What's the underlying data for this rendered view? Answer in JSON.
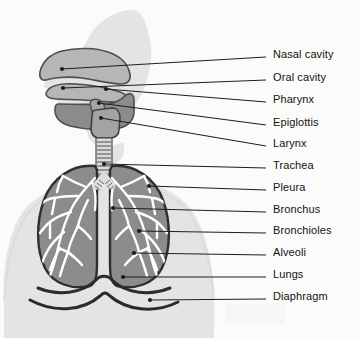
{
  "figure": {
    "orientation": "anterior torso with left-facing head profile",
    "background_color": "#fbfbfa",
    "colors": {
      "body_silhouette": "#e3e3e1",
      "lung_fill": "#8c8c8c",
      "lung_outline": "#2f2f2f",
      "bronchial_tree": "#ffffff",
      "pharynx_fill": "#8a8a8a",
      "cavity_fill": "#b4b4b2",
      "airway_outline": "#4a4a4a",
      "diaphragm": "#2b2b2b",
      "leader_line": "#1d1d1d",
      "label_text": "#131313"
    }
  },
  "labels": [
    {
      "id": "nasal-cavity",
      "text": "Nasal cavity",
      "x": 273,
      "y": 57,
      "anchor_x": 62,
      "anchor_y": 69
    },
    {
      "id": "oral-cavity",
      "text": "Oral cavity",
      "x": 273,
      "y": 80,
      "anchor_x": 63,
      "anchor_y": 88
    },
    {
      "id": "pharynx",
      "text": "Pharynx",
      "x": 273,
      "y": 102,
      "anchor_x": 106,
      "anchor_y": 89
    },
    {
      "id": "epiglottis",
      "text": "Epiglottis",
      "x": 273,
      "y": 125,
      "anchor_x": 99,
      "anchor_y": 103
    },
    {
      "id": "larynx",
      "text": "Larynx",
      "x": 273,
      "y": 146,
      "anchor_x": 101,
      "anchor_y": 118
    },
    {
      "id": "trachea",
      "text": "Trachea",
      "x": 273,
      "y": 168,
      "anchor_x": 104,
      "anchor_y": 164
    },
    {
      "id": "pleura",
      "text": "Pleura",
      "x": 273,
      "y": 190,
      "anchor_x": 149,
      "anchor_y": 186
    },
    {
      "id": "bronchus",
      "text": "Bronchus",
      "x": 273,
      "y": 212,
      "anchor_x": 113,
      "anchor_y": 208
    },
    {
      "id": "bronchioles",
      "text": "Bronchioles",
      "x": 273,
      "y": 233,
      "anchor_x": 139,
      "anchor_y": 231
    },
    {
      "id": "alveoli",
      "text": "Alveoli",
      "x": 273,
      "y": 255,
      "anchor_x": 134,
      "anchor_y": 253
    },
    {
      "id": "lungs",
      "text": "Lungs",
      "x": 273,
      "y": 277,
      "anchor_x": 123,
      "anchor_y": 277
    },
    {
      "id": "diaphragm",
      "text": "Diaphragm",
      "x": 273,
      "y": 299,
      "anchor_x": 150,
      "anchor_y": 300
    }
  ],
  "structures": [
    {
      "id": "body-silhouette",
      "name": "Head and torso silhouette"
    },
    {
      "id": "nasal-cavity-shape",
      "name": "Nasal cavity passage"
    },
    {
      "id": "oral-cavity-shape",
      "name": "Oral cavity"
    },
    {
      "id": "pharynx-shape",
      "name": "Pharynx"
    },
    {
      "id": "epiglottis-shape",
      "name": "Epiglottis"
    },
    {
      "id": "larynx-shape",
      "name": "Larynx"
    },
    {
      "id": "trachea-shape",
      "name": "Trachea with cartilage rings"
    },
    {
      "id": "left-lung-shape",
      "name": "Left lung"
    },
    {
      "id": "right-lung-shape",
      "name": "Right lung"
    },
    {
      "id": "bronchial-tree-shape",
      "name": "Bronchial tree"
    },
    {
      "id": "diaphragm-shape",
      "name": "Diaphragm"
    }
  ]
}
